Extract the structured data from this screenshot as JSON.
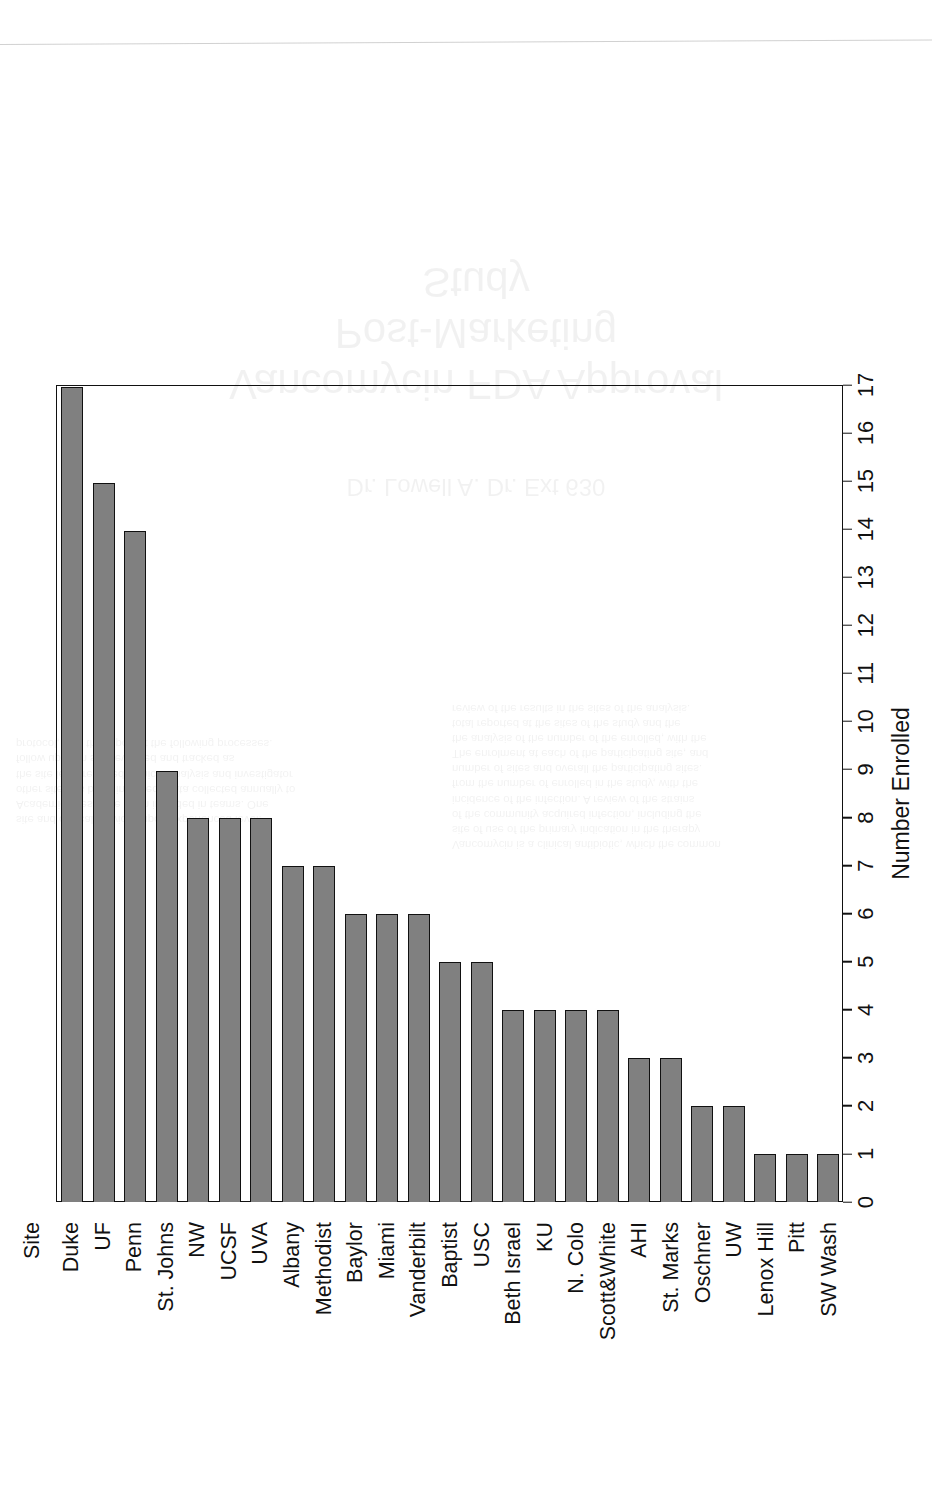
{
  "chart_data": {
    "type": "bar",
    "orientation": "horizontal",
    "title": "",
    "xlabel": "Number Enrolled",
    "ylabel": "Site",
    "xlim": [
      0,
      17
    ],
    "xticks": [
      0,
      1,
      2,
      3,
      4,
      5,
      6,
      7,
      8,
      9,
      10,
      11,
      12,
      13,
      14,
      15,
      16,
      17
    ],
    "grid": false,
    "legend": null,
    "bar_color": "#808080",
    "bar_edge_color": "#111111",
    "categories": [
      "Duke",
      "UF",
      "Penn",
      "St. Johns",
      "NW",
      "UCSF",
      "UVA",
      "Albany",
      "Methodist",
      "Baylor",
      "Miami",
      "Vanderbilt",
      "Baptist",
      "USC",
      "Beth Israel",
      "KU",
      "N. Colo",
      "Scott&White",
      "AHI",
      "St. Marks",
      "Oschner",
      "UW",
      "Lenox Hill",
      "Pitt",
      "SW Wash"
    ],
    "values": [
      17,
      15,
      14,
      9,
      8,
      8,
      8,
      7,
      7,
      6,
      6,
      6,
      5,
      5,
      4,
      4,
      4,
      4,
      3,
      3,
      2,
      2,
      1,
      1,
      1
    ]
  },
  "page": {
    "bleed_title": "Vancomycin FDA Approval\nPost-Marketing\nStudy",
    "bleed_subtitle": "Dr. Lowell A. Dr. Ext 630",
    "bleed_body_left": "site and clinical services upon experienced level.\nAcademic sites have been included in teams. One\nother site has been included. Data collected annually to\nthe site level required, clinical analysis and investigator\nfollow up from site reviewed and tracked as\nprotocol, with the report at the following processes.",
    "bleed_body_right": "Vancomycin is a clinical antibiotic, which the common\nsite of use of the primary indication in the therapy\nof the community acquired infection, including the\nincidence of the infection. A review of the strains\nfrom the number of enrolled in the study, with the\nnumber of sites and overall the participating sites.\nThe enrolment at each of the participating site, and\nthe analysis of the number of the enrolled, with the\ntotal reported at the sites of the study and the\nreview of the results in the sites of the analysis."
  }
}
